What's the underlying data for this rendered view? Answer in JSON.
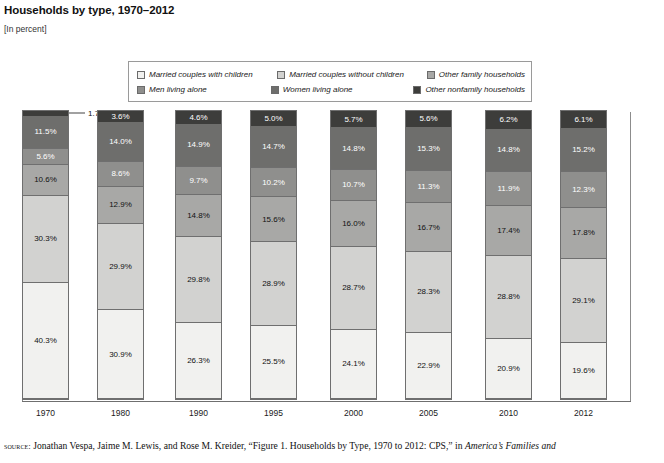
{
  "figure": {
    "title": "Households by type, 1970–2012",
    "units": "[In percent]",
    "source_prefix": "source:",
    "source_text_a": " Jonathan Vespa, Jaime M. Lewis, and Rose M. Kreider, “Figure 1. Households by Type, 1970 to 2012: CPS,” in ",
    "source_text_italic": "America’s Families and"
  },
  "legend": {
    "items": [
      {
        "label": "Married couples with children",
        "color": "#f1f1ef",
        "key": "married-with-children"
      },
      {
        "label": "Married couples without children",
        "color": "#d2d2d0",
        "key": "married-without-children"
      },
      {
        "label": "Other family households",
        "color": "#a8a8a6",
        "key": "other-family"
      },
      {
        "label": "Men living alone",
        "color": "#8f8f8d",
        "key": "men-living-alone"
      },
      {
        "label": "Women living alone",
        "color": "#6e6e6c",
        "key": "women-living-alone"
      },
      {
        "label": "Other nonfamily households",
        "color": "#3d3d3b",
        "key": "other-nonfamily"
      }
    ]
  },
  "chart_data": {
    "type": "bar",
    "stacked": true,
    "title": "Households by type, 1970–2012",
    "xlabel": "",
    "ylabel": "",
    "units": "percent",
    "ylim": [
      0,
      100
    ],
    "grid": false,
    "legend_position": "top",
    "categories": [
      "1970",
      "1980",
      "1990",
      "1995",
      "2000",
      "2005",
      "2010",
      "2012"
    ],
    "series": [
      {
        "name": "Married couples with children",
        "color": "#f1f1ef",
        "values": [
          40.3,
          30.9,
          26.3,
          25.5,
          24.1,
          22.9,
          20.9,
          19.6
        ]
      },
      {
        "name": "Married couples without children",
        "color": "#d2d2d0",
        "values": [
          30.3,
          29.9,
          29.8,
          28.9,
          28.7,
          28.3,
          28.8,
          29.1
        ]
      },
      {
        "name": "Other family households",
        "color": "#a8a8a6",
        "values": [
          10.6,
          12.9,
          14.8,
          15.6,
          16.0,
          16.7,
          17.4,
          17.8
        ]
      },
      {
        "name": "Men living alone",
        "color": "#8f8f8d",
        "values": [
          5.6,
          8.6,
          9.7,
          10.2,
          10.7,
          11.3,
          11.9,
          12.3
        ]
      },
      {
        "name": "Women living alone",
        "color": "#6e6e6c",
        "values": [
          11.5,
          14.0,
          14.9,
          14.7,
          14.8,
          15.3,
          14.8,
          15.2
        ]
      },
      {
        "name": "Other nonfamily households",
        "color": "#3d3d3b",
        "values": [
          1.7,
          3.6,
          4.6,
          5.0,
          5.7,
          5.6,
          6.2,
          6.1
        ]
      }
    ],
    "data_labels": [
      [
        "40.3%",
        "30.3%",
        "10.6%",
        "5.6%",
        "11.5%",
        "1.7%"
      ],
      [
        "30.9%",
        "29.9%",
        "12.9%",
        "8.6%",
        "14.0%",
        "3.6%"
      ],
      [
        "26.3%",
        "29.8%",
        "14.8%",
        "9.7%",
        "14.9%",
        "4.6%"
      ],
      [
        "25.5%",
        "28.9%",
        "15.6%",
        "10.2%",
        "14.7%",
        "5.0%"
      ],
      [
        "24.1%",
        "28.7%",
        "16.0%",
        "10.7%",
        "14.8%",
        "5.7%"
      ],
      [
        "22.9%",
        "28.3%",
        "16.7%",
        "11.3%",
        "15.3%",
        "5.6%"
      ],
      [
        "20.9%",
        "28.8%",
        "17.4%",
        "11.9%",
        "14.8%",
        "6.2%"
      ],
      [
        "19.6%",
        "29.1%",
        "17.8%",
        "12.3%",
        "15.2%",
        "6.1%"
      ]
    ]
  }
}
